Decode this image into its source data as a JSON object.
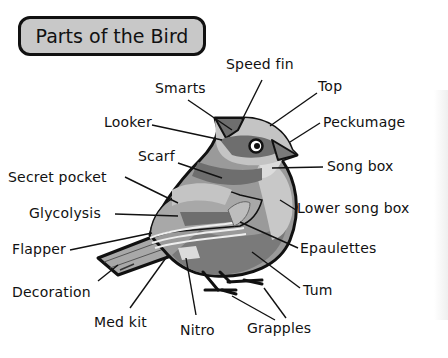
{
  "title": "Parts of the Bird",
  "labels": {
    "speed_fin": "Speed fin",
    "smarts": "Smarts",
    "top": "Top",
    "looker": "Looker",
    "peckumage": "Peckumage",
    "scarf": "Scarf",
    "song_box": "Song box",
    "secret_pocket": "Secret pocket",
    "lower_song_box": "Lower song box",
    "glycolysis": "Glycolysis",
    "flapper": "Flapper",
    "epaulettes": "Epaulettes",
    "decoration": "Decoration",
    "tum": "Tum",
    "med_kit": "Med kit",
    "nitro": "Nitro",
    "grapples": "Grapples"
  },
  "colors": {
    "outline": "#111111",
    "title_fill": "#c8c8c8",
    "light_gray": "#c4c4c4",
    "mid_gray": "#9a9a9a",
    "dark_gray": "#6e6e6e",
    "pale_gray": "#dcdcdc"
  }
}
